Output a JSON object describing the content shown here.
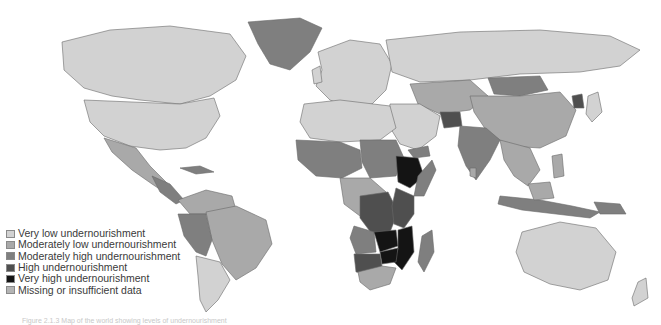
{
  "map": {
    "title": "World undernourishment map",
    "categories": [
      {
        "key": "very_low",
        "label": "Very low undernourishment",
        "color": "#d2d2d2"
      },
      {
        "key": "mod_low",
        "label": "Moderately low undernourishment",
        "color": "#a9a9a9"
      },
      {
        "key": "mod_high",
        "label": "Moderately high undernourishment",
        "color": "#7f7f7f"
      },
      {
        "key": "high",
        "label": "High undernourishment",
        "color": "#4f4f4f"
      },
      {
        "key": "very_high",
        "label": "Very high undernourishment",
        "color": "#141414"
      },
      {
        "key": "missing",
        "label": "Missing or insufficient data",
        "color": "#b4b4b4"
      }
    ]
  },
  "legend": {
    "items": [
      {
        "label": "Very low undernourishment"
      },
      {
        "label": "Moderately low undernourishment"
      },
      {
        "label": "Moderately high undernourishment"
      },
      {
        "label": "High undernourishment"
      },
      {
        "label": "Very high undernourishment"
      },
      {
        "label": "Missing or insufficient data"
      }
    ]
  },
  "caption": {
    "text": "Figure 2.1.3  Map of the world showing levels of undernourishment"
  }
}
